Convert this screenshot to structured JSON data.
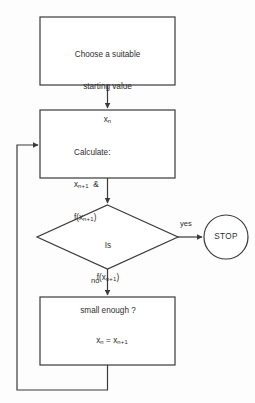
{
  "diagram": {
    "colors": {
      "stroke": "#3a3a3a",
      "background": "#fdfdfd",
      "text": "#2e2e2e"
    },
    "nodes": {
      "start_box": {
        "shape": "rectangle",
        "line1": "Choose a suitable",
        "line2": "starting value",
        "line3_base": "x",
        "line3_sub": "n"
      },
      "calculate_box": {
        "shape": "rectangle",
        "line1": "Calculate:",
        "line2_base": "x",
        "line2_sub": "n+1",
        "line2_suffix": "&",
        "line3_base": "f(x",
        "line3_sub": "n+1",
        "line3_suffix": ")"
      },
      "decision": {
        "shape": "diamond",
        "line1": "Is",
        "line2_base": "f(x",
        "line2_sub": "n+1",
        "line2_suffix": ")",
        "line3": "small enough ?"
      },
      "assign_box": {
        "shape": "rectangle",
        "lhs_base": "x",
        "lhs_sub": "n",
        "operator": "=",
        "rhs_base": "x",
        "rhs_sub": "n+1"
      },
      "stop_terminal": {
        "shape": "circle",
        "label": "STOP"
      }
    },
    "edges": {
      "yes_label": "yes",
      "no_label": "no"
    }
  }
}
